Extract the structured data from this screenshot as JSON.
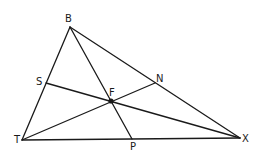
{
  "diagram": {
    "type": "triangle with cevians",
    "points": {
      "B": {
        "label": "B",
        "x": 70,
        "y": 27
      },
      "T": {
        "label": "T",
        "x": 22,
        "y": 140
      },
      "X": {
        "label": "X",
        "x": 240,
        "y": 138
      },
      "S": {
        "label": "S",
        "x": 46,
        "y": 83
      },
      "N": {
        "label": "N",
        "x": 155,
        "y": 83
      },
      "F": {
        "label": "F",
        "x": 111,
        "y": 101
      },
      "P": {
        "label": "P",
        "x": 132,
        "y": 139
      }
    },
    "segments": [
      "BT",
      "BX",
      "TX",
      "BP",
      "SX",
      "TN"
    ],
    "line_color": "#1a1a1a",
    "point_F_filled": true
  }
}
